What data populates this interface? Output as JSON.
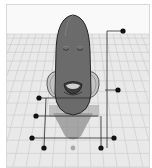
{
  "viewport": {
    "name": "3D workplane viewport",
    "sky_color": "#f8f8f8",
    "grid_color": "#c9c9c9",
    "floor_color": "#e6e6e6",
    "border_color": "#d8d8d8"
  },
  "model": {
    "name": "character-shape",
    "body_color": "#6a6a6a",
    "body_outline": "#2a2a2a",
    "ear_color": "#bdbdbd",
    "shadow_color": "#8a8a8a"
  },
  "handles": {
    "color": "#111111",
    "center_handle_color": "#a9a9a9",
    "points": [
      {
        "id": "height-handle",
        "x": 122,
        "y": 30
      },
      {
        "id": "side-right-handle",
        "x": 117,
        "y": 89
      },
      {
        "id": "side-left-upper-handle",
        "x": 38,
        "y": 97
      },
      {
        "id": "side-left-mid-handle",
        "x": 35,
        "y": 115
      },
      {
        "id": "corner-back-left-handle",
        "x": 31,
        "y": 137
      },
      {
        "id": "corner-back-right-handle",
        "x": 113,
        "y": 137
      },
      {
        "id": "corner-front-left-handle",
        "x": 43,
        "y": 147
      },
      {
        "id": "corner-front-right-handle",
        "x": 100,
        "y": 147
      }
    ],
    "center": {
      "id": "center-handle",
      "x": 72,
      "y": 147
    }
  }
}
